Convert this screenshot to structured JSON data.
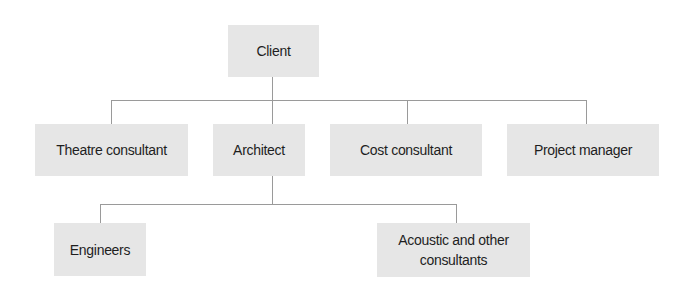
{
  "diagram": {
    "type": "org-chart",
    "root": {
      "label": "Client"
    },
    "level1": [
      {
        "label": "Theatre consultant"
      },
      {
        "label": "Architect"
      },
      {
        "label": "Cost consultant"
      },
      {
        "label": "Project manager"
      }
    ],
    "level2_parent": "Architect",
    "level2": [
      {
        "label": "Engineers"
      },
      {
        "label": "Acoustic and other consultants",
        "lines": [
          "Acoustic and other",
          "consultants"
        ]
      }
    ],
    "colors": {
      "box_fill": "#e6e6e6",
      "line": "#9a9a9a",
      "text": "#1e1e1e"
    }
  }
}
